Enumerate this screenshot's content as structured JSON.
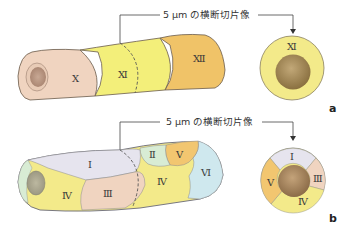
{
  "panel_a": {
    "label": "a",
    "caption": "5 μm の横断切片像",
    "tube_segments": [
      {
        "label": "Ⅹ",
        "color": "#f0d4c0"
      },
      {
        "label": "Ⅺ",
        "color": "#f3ef7a"
      },
      {
        "label": "Ⅻ",
        "color": "#f0c368"
      }
    ],
    "cross_section": {
      "labels": [
        "Ⅺ"
      ],
      "ring_color": "#f3ea8a",
      "lumen_color": "#a89060"
    }
  },
  "panel_b": {
    "label": "b",
    "caption": "5 μm の横断切片像",
    "tube_segments": [
      {
        "label": "Ⅰ",
        "color": "#e6e4ee"
      },
      {
        "label": "Ⅱ",
        "color": "#d8ecd4"
      },
      {
        "label": "Ⅲ",
        "color": "#f0d4c0"
      },
      {
        "label": "Ⅳ",
        "color": "#f3ea8a"
      },
      {
        "label": "Ⅳ",
        "color": "#f3ea8a"
      },
      {
        "label": "Ⅴ",
        "color": "#f2c670"
      },
      {
        "label": "Ⅵ",
        "color": "#cfe8ee"
      }
    ],
    "cross_section": {
      "labels": [
        "Ⅰ",
        "Ⅲ",
        "Ⅳ",
        "Ⅴ"
      ],
      "lumen_color": "#a88a62"
    }
  }
}
